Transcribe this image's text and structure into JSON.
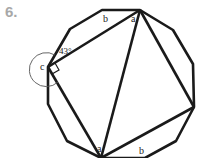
{
  "problem_number": "6.",
  "labels": {
    "top_a": "a",
    "top_b": "b",
    "bottom_a": "a",
    "bottom_b": "b",
    "c": "c",
    "angle": "43°"
  },
  "colors": {
    "line": "#1a1a1a",
    "arc": "#555555",
    "number": "#a8a8a8"
  }
}
